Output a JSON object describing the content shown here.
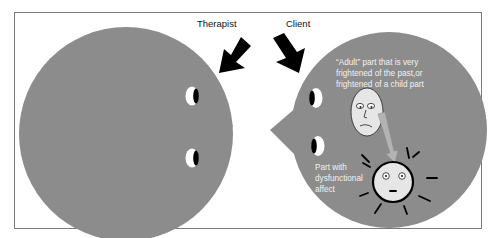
{
  "colors": {
    "head_fill": "#8c8c8c",
    "frame_stroke": "#7a7a7a",
    "arrow_fill": "#000000",
    "face_fill": "#e6e6e6",
    "gray_arrow_fill": "#b3b3b3",
    "annotation_text": "#f2f2f2",
    "label_text": "#111111"
  },
  "labels": {
    "therapist": "Therapist",
    "client": "Client"
  },
  "client_head": {
    "adult_part_lines": [
      "“Adult” part that is very",
      "frightened of the past,or",
      "frightened of a child part"
    ],
    "dysfunctional_part_lines": [
      "Part with",
      "dysfunctional",
      "affect"
    ]
  }
}
